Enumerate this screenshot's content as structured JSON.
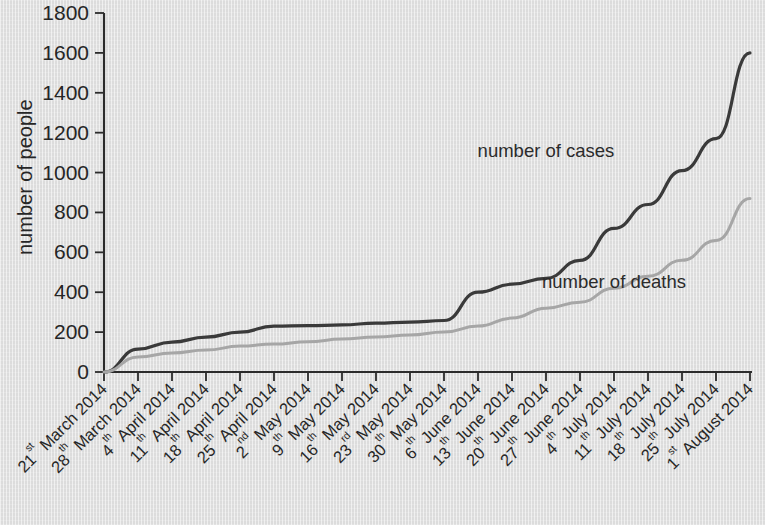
{
  "chart_data": {
    "type": "line",
    "title": "",
    "subtitle": "",
    "xlabel": "",
    "ylabel": "number of people",
    "ylim": [
      0,
      1800
    ],
    "ytick_step": 200,
    "yticks": [
      0,
      200,
      400,
      600,
      800,
      1000,
      1200,
      1400,
      1600,
      1800
    ],
    "grid": false,
    "legend_position": "inline-annotations",
    "categories": [
      "21st March 2014",
      "28th March 2014",
      "4th April 2014",
      "11th April 2014",
      "18th April 2014",
      "25th April 2014",
      "2nd May 2014",
      "9th May 2014",
      "16th May 2014",
      "23rd May 2014",
      "30th May 2014",
      "6th June 2014",
      "13th June 2014",
      "20th June 2014",
      "27th June 2014",
      "4th July 2014",
      "11th July 2014",
      "18th July 2014",
      "25th July 2014",
      "1st August 2014"
    ],
    "xtick_parts": [
      {
        "day": "21",
        "sup": "st",
        "rest": " March 2014"
      },
      {
        "day": "28",
        "sup": "th",
        "rest": " March 2014"
      },
      {
        "day": "4",
        "sup": "th",
        "rest": " April 2014"
      },
      {
        "day": "11",
        "sup": "th",
        "rest": " April 2014"
      },
      {
        "day": "18",
        "sup": "th",
        "rest": " April 2014"
      },
      {
        "day": "25",
        "sup": "th",
        "rest": " April 2014"
      },
      {
        "day": "2",
        "sup": "nd",
        "rest": " May 2014"
      },
      {
        "day": "9",
        "sup": "th",
        "rest": " May 2014"
      },
      {
        "day": "16",
        "sup": "th",
        "rest": " May 2014"
      },
      {
        "day": "23",
        "sup": "rd",
        "rest": " May 2014"
      },
      {
        "day": "30",
        "sup": "th",
        "rest": " May 2014"
      },
      {
        "day": "6",
        "sup": "th",
        "rest": " June 2014"
      },
      {
        "day": "13",
        "sup": "th",
        "rest": " June 2014"
      },
      {
        "day": "20",
        "sup": "th",
        "rest": " June 2014"
      },
      {
        "day": "27",
        "sup": "th",
        "rest": " June 2014"
      },
      {
        "day": "4",
        "sup": "th",
        "rest": " July 2014"
      },
      {
        "day": "11",
        "sup": "th",
        "rest": " July 2014"
      },
      {
        "day": "18",
        "sup": "th",
        "rest": " July 2014"
      },
      {
        "day": "25",
        "sup": "th",
        "rest": " July 2014"
      },
      {
        "day": "1",
        "sup": "st",
        "rest": " August 2014"
      }
    ],
    "series": [
      {
        "name": "number of cases",
        "color": "#3a3a3a",
        "label_text": "number of cases",
        "values": [
          0,
          115,
          150,
          175,
          200,
          230,
          232,
          236,
          245,
          250,
          258,
          400,
          440,
          470,
          560,
          720,
          840,
          1010,
          1170,
          1600
        ]
      },
      {
        "name": "number of deaths",
        "color": "#a6a6a6",
        "label_text": "number of deaths",
        "values": [
          0,
          75,
          95,
          110,
          130,
          140,
          152,
          165,
          175,
          185,
          200,
          230,
          270,
          320,
          350,
          420,
          480,
          560,
          660,
          870
        ]
      }
    ],
    "annotations": [
      {
        "text": "number of cases",
        "x_category": "20th June 2014",
        "y_value": 1080
      },
      {
        "text": "number of deaths",
        "x_category": "4th July 2014",
        "y_value": 420
      }
    ]
  },
  "colors": {
    "background": "#dcdcdc",
    "axis": "#2b2b2b",
    "cases_line": "#3a3a3a",
    "deaths_line": "#a6a6a6",
    "text": "#262626"
  }
}
